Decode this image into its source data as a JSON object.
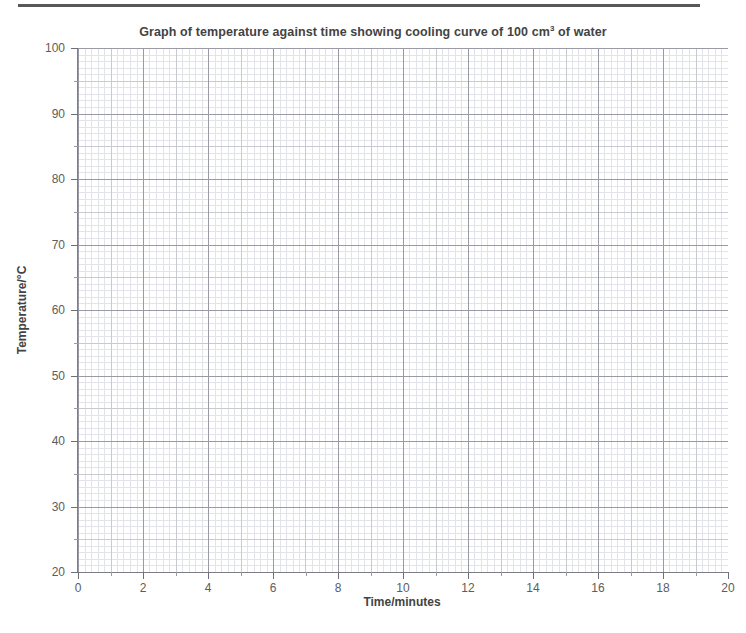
{
  "chart_data": {
    "type": "line",
    "title_main": "Graph of temperature against time showing cooling curve of 100 cm",
    "title_sup": "3",
    "title_tail": " of water",
    "xlabel": "Time/minutes",
    "ylabel": "Temperature/°C",
    "xlim": [
      0,
      20
    ],
    "ylim": [
      20,
      100
    ],
    "xticks": [
      0,
      2,
      4,
      6,
      8,
      10,
      12,
      14,
      16,
      18,
      20
    ],
    "yticks": [
      20,
      30,
      40,
      50,
      60,
      70,
      80,
      90,
      100
    ],
    "xtick_labels": [
      "0",
      "2",
      "4",
      "6",
      "8",
      "10",
      "12",
      "14",
      "16",
      "18",
      "20"
    ],
    "ytick_labels": [
      "20",
      "30",
      "40",
      "50",
      "60",
      "70",
      "80",
      "90",
      "100"
    ],
    "x_minor_step": 0.2,
    "y_minor_step": 1,
    "x_medium_step": 1,
    "y_medium_step": 5,
    "grid": true,
    "grid_style": "graph-paper",
    "legend": null,
    "series": [],
    "annotations": [],
    "note": "Blank graph-paper grid; no data plotted."
  },
  "colors": {
    "grid_minor": "#e3e3ea",
    "grid_medium": "#c9c9d2",
    "grid_major": "#9a9aa6",
    "axis": "#7d7d86",
    "text": "#434343",
    "tick_text": "#5d5d5d",
    "rule": "#585858",
    "background": "#ffffff"
  },
  "page": {
    "top_rule": "horizontal-rule"
  }
}
